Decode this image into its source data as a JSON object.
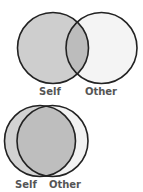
{
  "diagrams": [
    {
      "name": "partial-overlap",
      "labels": {
        "self": "Self",
        "other": "Other"
      },
      "self_circle": {
        "cx": 53,
        "cy": 48,
        "r": 35.5
      },
      "other_circle": {
        "cx": 101.5,
        "cy": 48,
        "r": 35.5
      },
      "label_y": 95,
      "self_label_x": 50,
      "other_label_x": 101
    },
    {
      "name": "large-overlap",
      "labels": {
        "self": "Self",
        "other": "Other"
      },
      "self_circle": {
        "cx": 40,
        "cy": 141,
        "r": 35.5
      },
      "other_circle": {
        "cx": 52.5,
        "cy": 141,
        "r": 35.5
      },
      "label_y": 188,
      "self_label_x": 26,
      "other_label_x": 65
    }
  ],
  "colors": {
    "self_fill": "#cecece",
    "other_fill": "#f4f4f4",
    "overlap_fill": "#bcbcbc",
    "stroke": "#222222",
    "label": "#555555"
  }
}
